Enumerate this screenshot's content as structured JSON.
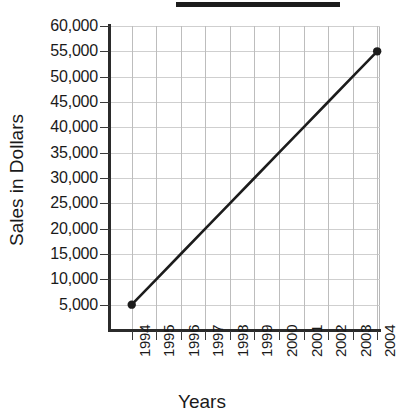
{
  "chart_data": {
    "type": "line",
    "title": "",
    "title_redacted": true,
    "xlabel": "Years",
    "ylabel": "Sales in Dollars",
    "categories": [
      "1994",
      "1995",
      "1996",
      "1997",
      "1998",
      "1999",
      "2000",
      "2001",
      "2002",
      "2003",
      "2004"
    ],
    "x_tick_labels": [
      "1994",
      "1995",
      "1996",
      "1997",
      "1998",
      "1999",
      "2000",
      "2001",
      "2002",
      "2003",
      "2004"
    ],
    "y_tick_labels": [
      "60,000",
      "55,000",
      "50,000",
      "45,000",
      "40,000",
      "35,000",
      "30,000",
      "25,000",
      "20,000",
      "15,000",
      "10,000",
      "5,000"
    ],
    "y_tick_values": [
      60000,
      55000,
      50000,
      45000,
      40000,
      35000,
      30000,
      25000,
      20000,
      15000,
      10000,
      5000
    ],
    "ylim": [
      0,
      60000
    ],
    "y_step": 5000,
    "grid": true,
    "legend": false,
    "series": [
      {
        "name": "Sales",
        "x": [
          "1994",
          "1995",
          "1996",
          "1997",
          "1998",
          "1999",
          "2000",
          "2001",
          "2002",
          "2003",
          "2004"
        ],
        "values": [
          5000,
          10000,
          15000,
          20000,
          25000,
          30000,
          35000,
          40000,
          45000,
          50000,
          55000
        ],
        "marked_points": [
          {
            "x": "1994",
            "y": 5000
          },
          {
            "x": "2004",
            "y": 55000
          }
        ],
        "line_color": "#1c1c1c",
        "marker_color": "#1c1c1c"
      }
    ],
    "colors": {
      "background": "#ffffff",
      "axis": "#2b2b2b",
      "gridline": "#cfcfcf",
      "text": "#1a1a1a",
      "redaction": "#1c1c1c"
    }
  }
}
